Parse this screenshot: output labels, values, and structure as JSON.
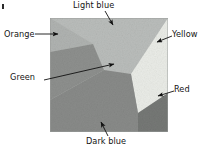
{
  "figure": {
    "name": "faceted-surface-diagram",
    "image_box": {
      "x": 50,
      "y": 18,
      "width": 118,
      "height": 114
    },
    "background_color": "#ffffff",
    "border_color": "#8c8c8c"
  },
  "labels": [
    {
      "id": "light-blue",
      "text": "Light blue",
      "tone": "#b9bcba"
    },
    {
      "id": "orange",
      "text": "Orange",
      "tone": "#b4b7b5"
    },
    {
      "id": "yellow",
      "text": "Yellow",
      "tone": "#eceee9"
    },
    {
      "id": "green",
      "text": "Green",
      "tone": "#8f918f"
    },
    {
      "id": "red",
      "text": "Red",
      "tone": "#787a78"
    },
    {
      "id": "dark-blue",
      "text": "Dark blue",
      "tone": "#8a8c8a"
    }
  ],
  "facets": [
    {
      "id": "light-blue",
      "label": "Light blue",
      "fill": "#babdbb",
      "points": "50,18 168,18 168,30 131,74 104,70 93,44"
    },
    {
      "id": "orange",
      "label": "Orange",
      "fill": "#b0b3b1",
      "points": "50,18 93,44 50,52"
    },
    {
      "id": "green",
      "label": "Green",
      "fill": "#8e908e",
      "points": "50,52 93,44 104,70 50,100"
    },
    {
      "id": "yellow",
      "label": "Yellow",
      "fill": "#eaece7",
      "points": "168,18 168,93 138,113 131,74"
    },
    {
      "id": "red",
      "label": "Red",
      "fill": "#767876",
      "points": "168,93 168,132 138,132 138,113"
    },
    {
      "id": "dark-blue",
      "label": "Dark blue",
      "fill": "#898b89",
      "points": "50,100 104,70 131,74 138,113 138,132 50,132"
    }
  ],
  "leaders": [
    {
      "id": "light-blue",
      "from": {
        "x": 105,
        "y": 11
      },
      "to": {
        "x": 113,
        "y": 25
      },
      "arrow": true
    },
    {
      "id": "orange",
      "from": {
        "x": 35,
        "y": 34
      },
      "to": {
        "x": 58,
        "y": 34
      },
      "arrow": true
    },
    {
      "id": "yellow",
      "from": {
        "x": 172,
        "y": 36
      },
      "to": {
        "x": 157,
        "y": 42
      },
      "arrow": true
    },
    {
      "id": "green",
      "from": {
        "x": 44,
        "y": 80
      },
      "to": {
        "x": 114,
        "y": 64
      },
      "arrow": true
    },
    {
      "id": "red",
      "from": {
        "x": 174,
        "y": 91
      },
      "to": {
        "x": 158,
        "y": 96
      },
      "arrow": true
    },
    {
      "id": "dark-blue",
      "from": {
        "x": 108,
        "y": 136
      },
      "to": {
        "x": 101,
        "y": 122
      },
      "arrow": true
    }
  ]
}
